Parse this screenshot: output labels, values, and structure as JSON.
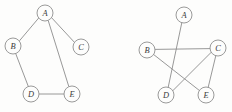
{
  "figure": {
    "background_color": "#fdfdfc",
    "edge_color": "#8c8c8c",
    "node_stroke_color": "#8e8e8e",
    "node_fill_color": "#fdfdfc",
    "label_color": "#3b3b3b",
    "node_radius": 8
  },
  "graphs": [
    {
      "id": "left-graph",
      "name": "graph-left",
      "nodes": [
        {
          "id": "A",
          "label": "A",
          "x": 45,
          "y": 13
        },
        {
          "id": "B",
          "label": "B",
          "x": 13,
          "y": 46
        },
        {
          "id": "C",
          "label": "C",
          "x": 81,
          "y": 47
        },
        {
          "id": "D",
          "label": "D",
          "x": 31,
          "y": 94
        },
        {
          "id": "E",
          "label": "E",
          "x": 72,
          "y": 94
        }
      ],
      "edges": [
        {
          "from": "A",
          "to": "B",
          "x1": 38.7,
          "y1": 18.0,
          "x2": 19.3,
          "y2": 41.0
        },
        {
          "from": "A",
          "to": "C",
          "x1": 51.6,
          "y1": 17.7,
          "x2": 74.4,
          "y2": 42.3
        },
        {
          "from": "A",
          "to": "E",
          "x1": 48.3,
          "y1": 20.8,
          "x2": 68.7,
          "y2": 86.2
        },
        {
          "from": "B",
          "to": "D",
          "x1": 15.7,
          "y1": 53.6,
          "x2": 28.3,
          "y2": 86.4
        },
        {
          "from": "D",
          "to": "E",
          "x1": 39.0,
          "y1": 94.0,
          "x2": 64.0,
          "y2": 94.0
        }
      ]
    },
    {
      "id": "right-graph",
      "name": "graph-right",
      "nodes": [
        {
          "id": "A",
          "label": "A",
          "x": 184,
          "y": 15
        },
        {
          "id": "B",
          "label": "B",
          "x": 147,
          "y": 50
        },
        {
          "id": "C",
          "label": "C",
          "x": 218,
          "y": 48
        },
        {
          "id": "D",
          "label": "D",
          "x": 166,
          "y": 95
        },
        {
          "id": "E",
          "label": "E",
          "x": 206,
          "y": 95
        }
      ],
      "edges": [
        {
          "from": "A",
          "to": "D",
          "x1": 181.8,
          "y1": 22.7,
          "x2": 168.2,
          "y2": 87.3
        },
        {
          "from": "B",
          "to": "C",
          "x1": 155.0,
          "y1": 49.4,
          "x2": 210.0,
          "y2": 48.6
        },
        {
          "from": "B",
          "to": "E",
          "x1": 153.6,
          "y1": 54.5,
          "x2": 199.4,
          "y2": 90.5
        },
        {
          "from": "C",
          "to": "D",
          "x1": 211.2,
          "y1": 52.3,
          "x2": 172.8,
          "y2": 90.7
        },
        {
          "from": "C",
          "to": "E",
          "x1": 215.8,
          "y1": 55.7,
          "x2": 208.2,
          "y2": 87.3
        }
      ]
    }
  ]
}
